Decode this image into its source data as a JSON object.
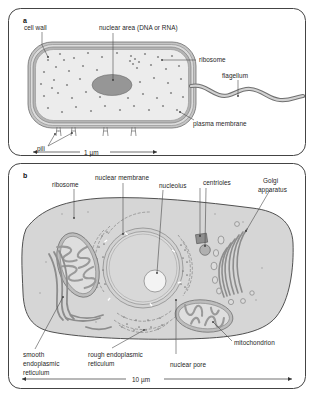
{
  "figure": {
    "title_a_marker": "a",
    "title_b_marker": "b"
  },
  "panel_a": {
    "name": "prokaryotic-bacterial-cell",
    "labels": {
      "cell_wall": "cell wall",
      "nuclear_area": "nuclear area (DNA or RNA)",
      "ribosome": "ribosome",
      "flagellum": "flagellum",
      "plasma_membrane": "plasma membrane",
      "pili": "pili"
    },
    "scale_bar": "1 µm"
  },
  "panel_b": {
    "name": "eukaryotic-animal-cell",
    "labels": {
      "ribosome": "ribosome",
      "nuclear_membrane": "nuclear membrane",
      "nucleolus": "nucleolus",
      "centrioles": "centrioles",
      "golgi_apparatus_line1": "Golgi",
      "golgi_apparatus_line2": "apparatus",
      "mitochondrion": "mitochondrion",
      "nuclear_pore": "nuclear pore",
      "rough_er_line1": "rough endoplasmic",
      "rough_er_line2": "reticulum",
      "smooth_er_line1": "smooth",
      "smooth_er_line2": "endoplasmic",
      "smooth_er_line3": "reticulum"
    },
    "scale_bar": "10 µm"
  },
  "colors": {
    "page_background": "#ffffff",
    "frame_stroke": "#444444",
    "cytoplasm_fill": "#d9d9d9",
    "bacterial_cytoplasm_fill": "#e8e8e8",
    "membrane_fill": "#b8b8b8",
    "nucleoid_fill": "#9a9a9a",
    "organelle_fill": "#c9c9c9",
    "organelle_stroke": "#8c8c8c",
    "nucleolus_fill": "#f2f2f2",
    "label_text": "#262626",
    "leader_line": "#4a4a4a"
  }
}
